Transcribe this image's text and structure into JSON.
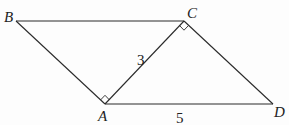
{
  "diagram": {
    "type": "geometry-figure",
    "points": {
      "A": {
        "label": "A",
        "x": 105,
        "y": 104
      },
      "B": {
        "label": "B",
        "x": 16,
        "y": 21
      },
      "C": {
        "label": "C",
        "x": 184,
        "y": 21
      },
      "D": {
        "label": "D",
        "x": 273,
        "y": 104
      }
    },
    "segments": [
      {
        "from": "B",
        "to": "C"
      },
      {
        "from": "B",
        "to": "A"
      },
      {
        "from": "A",
        "to": "C"
      },
      {
        "from": "C",
        "to": "D"
      },
      {
        "from": "A",
        "to": "D"
      }
    ],
    "right_angles": [
      {
        "vertex": "A",
        "between": [
          "B",
          "C"
        ]
      },
      {
        "vertex": "C",
        "between": [
          "A",
          "D"
        ]
      }
    ],
    "lengths": {
      "AC": "3",
      "AD": "5"
    },
    "colors": {
      "line": "#2a2a2a",
      "text": "#222222",
      "background": "#fdfdfd"
    }
  }
}
